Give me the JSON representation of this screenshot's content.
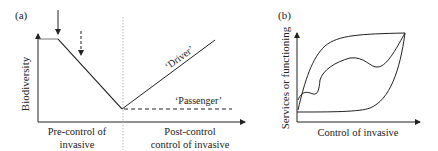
{
  "panel_a": {
    "label": "(a)",
    "y_axis_label": "Biodiversity",
    "x_label_left_line1": "Pre-control of",
    "x_label_left_line2": "invasive",
    "x_label_right_line1": "Post-control",
    "x_label_right_line2": "control of invasive",
    "driver_label": "‘Driver’",
    "passenger_label": "‘Passenger’"
  },
  "panel_b": {
    "label": "(b)",
    "y_axis_label": "Services or functioning",
    "x_axis_label": "Control of invasive"
  },
  "colors": {
    "line": "#222222",
    "divider": "#bbbbbb"
  }
}
